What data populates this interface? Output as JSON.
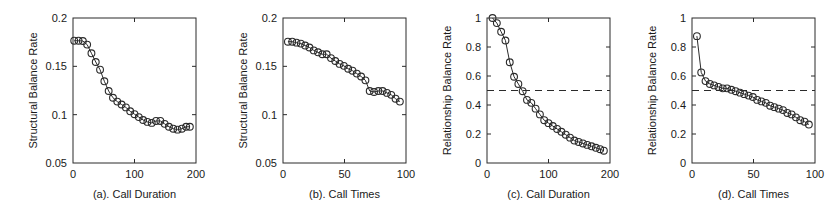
{
  "figure": {
    "background_color": "#ffffff",
    "ink_color": "#2b2b2b",
    "marker_shape": "circle",
    "panel_count": 4
  },
  "chart_data": [
    {
      "type": "line",
      "panel_id": "a",
      "title": "(a). Call Duration",
      "xlabel": "(a). Call Duration",
      "ylabel": "Structural Balance Rate",
      "xlim": [
        0,
        200
      ],
      "ylim": [
        0.05,
        0.2
      ],
      "xticks": [
        0,
        100,
        200
      ],
      "xtick_labels": [
        "0",
        "100",
        "200"
      ],
      "yticks": [
        0.05,
        0.1,
        0.15,
        0.2
      ],
      "ytick_labels": [
        "0.05",
        "0.1",
        "0.15",
        "0.2"
      ],
      "grid": false,
      "legend": "none",
      "marker": "circle",
      "x": [
        2,
        9,
        16,
        23,
        30,
        37,
        44,
        51,
        58,
        65,
        72,
        79,
        86,
        93,
        100,
        107,
        114,
        121,
        128,
        135,
        142,
        149,
        156,
        163,
        170,
        177,
        184,
        190
      ],
      "values": [
        0.1765,
        0.1765,
        0.1762,
        0.1725,
        0.1635,
        0.1545,
        0.1465,
        0.1345,
        0.1245,
        0.1175,
        0.1135,
        0.1105,
        0.1075,
        0.1035,
        0.1005,
        0.0975,
        0.0945,
        0.0925,
        0.0915,
        0.0935,
        0.0935,
        0.0905,
        0.0875,
        0.0855,
        0.0845,
        0.0855,
        0.0875,
        0.0875
      ]
    },
    {
      "type": "line",
      "panel_id": "b",
      "title": "(b). Call Times",
      "xlabel": "(b). Call Times",
      "ylabel": "Structural Balance Rate",
      "xlim": [
        0,
        100
      ],
      "ylim": [
        0.05,
        0.2
      ],
      "xticks": [
        0,
        50,
        100
      ],
      "xtick_labels": [
        "0",
        "50",
        "100"
      ],
      "yticks": [
        0.05,
        0.1,
        0.15,
        0.2
      ],
      "ytick_labels": [
        "0.05",
        "0.1",
        "0.15",
        "0.2"
      ],
      "grid": false,
      "legend": "none",
      "marker": "circle",
      "x": [
        4,
        7.5,
        11,
        14.5,
        18,
        21.5,
        25,
        28.5,
        32,
        35.5,
        39,
        42.5,
        46,
        49.5,
        53,
        56.5,
        60,
        63.5,
        67,
        70.5,
        74,
        77.5,
        81,
        84.5,
        88,
        91.5,
        95
      ],
      "values": [
        0.1755,
        0.1755,
        0.1745,
        0.1735,
        0.1715,
        0.1695,
        0.1665,
        0.1645,
        0.1625,
        0.1625,
        0.1585,
        0.1555,
        0.1525,
        0.1505,
        0.1475,
        0.1455,
        0.1425,
        0.1395,
        0.1355,
        0.1245,
        0.1235,
        0.1245,
        0.1245,
        0.1225,
        0.1205,
        0.1165,
        0.1135
      ]
    },
    {
      "type": "line",
      "panel_id": "c",
      "title": "(c). Call Duration",
      "xlabel": "(c). Call Duration",
      "ylabel": "Relationship Balance Rate",
      "xlim": [
        0,
        200
      ],
      "ylim": [
        0,
        1
      ],
      "xticks": [
        0,
        100,
        200
      ],
      "xtick_labels": [
        "0",
        "100",
        "200"
      ],
      "yticks": [
        0,
        0.2,
        0.4,
        0.6,
        0.8,
        1
      ],
      "ytick_labels": [
        "0",
        "0.2",
        "0.4",
        "0.6",
        "0.8",
        "1"
      ],
      "grid": false,
      "legend": "none",
      "marker": "circle",
      "reference_line": {
        "orientation": "horizontal",
        "value": 0.5,
        "style": "dashed"
      },
      "x": [
        9,
        16,
        23,
        30,
        37,
        44,
        51,
        58,
        65,
        72,
        79,
        86,
        93,
        100,
        107,
        114,
        121,
        128,
        135,
        142,
        149,
        156,
        163,
        170,
        177,
        184,
        190
      ],
      "values": [
        1.0,
        0.965,
        0.905,
        0.845,
        0.695,
        0.595,
        0.545,
        0.495,
        0.435,
        0.415,
        0.375,
        0.335,
        0.295,
        0.275,
        0.255,
        0.235,
        0.215,
        0.195,
        0.175,
        0.155,
        0.145,
        0.135,
        0.125,
        0.115,
        0.105,
        0.095,
        0.085
      ]
    },
    {
      "type": "line",
      "panel_id": "d",
      "title": "(d). Call Times",
      "xlabel": "(d). Call Times",
      "ylabel": "Relationship Balance Rate",
      "xlim": [
        0,
        100
      ],
      "ylim": [
        0,
        1
      ],
      "xticks": [
        0,
        50,
        100
      ],
      "xtick_labels": [
        "0",
        "50",
        "100"
      ],
      "yticks": [
        0,
        0.2,
        0.4,
        0.6,
        0.8,
        1
      ],
      "ytick_labels": [
        "0",
        "0.2",
        "0.4",
        "0.6",
        "0.8",
        "1"
      ],
      "grid": false,
      "legend": "none",
      "marker": "circle",
      "reference_line": {
        "orientation": "horizontal",
        "value": 0.5,
        "style": "dashed"
      },
      "x": [
        4,
        7.5,
        11,
        14.5,
        18,
        21.5,
        25,
        28.5,
        32,
        35.5,
        39,
        42.5,
        46,
        49.5,
        53,
        56.5,
        60,
        63.5,
        67,
        70.5,
        74,
        77.5,
        81,
        84.5,
        88,
        91.5,
        95
      ],
      "values": [
        0.875,
        0.625,
        0.565,
        0.545,
        0.535,
        0.525,
        0.515,
        0.515,
        0.505,
        0.495,
        0.485,
        0.475,
        0.465,
        0.455,
        0.435,
        0.425,
        0.415,
        0.395,
        0.385,
        0.375,
        0.365,
        0.345,
        0.335,
        0.315,
        0.295,
        0.285,
        0.265
      ]
    }
  ]
}
